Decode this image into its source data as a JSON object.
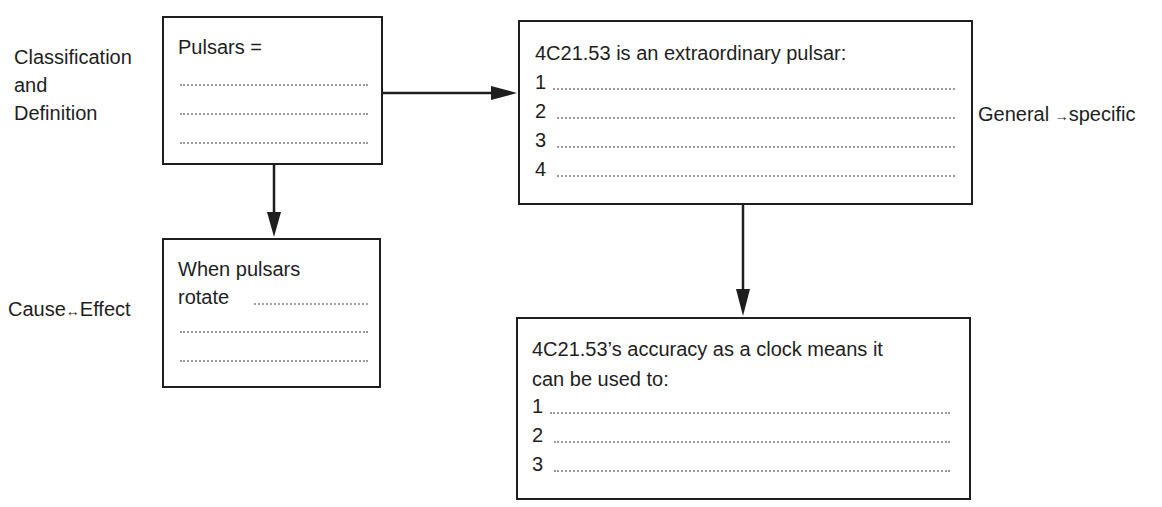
{
  "side_labels": {
    "classification": [
      "Classification",
      "and",
      "Definition"
    ],
    "cause_effect": {
      "left": "Cause",
      "arrow": "↔",
      "right": "Effect"
    },
    "general_specific": {
      "left": "General",
      "arrow": "→",
      "right": "specific"
    }
  },
  "boxes": {
    "pulsars": {
      "title": "Pulsars =",
      "blank_lines": 3
    },
    "extraordinary": {
      "title": "4C21.53 is an extraordinary pulsar:",
      "items": [
        "1",
        "2",
        "3",
        "4"
      ]
    },
    "rotate": {
      "title_line1": "When pulsars",
      "title_line2": "rotate",
      "blank_lines": 3
    },
    "clock": {
      "title_line1": "4C21.53’s accuracy as a clock means it",
      "title_line2": "can be used to:",
      "items": [
        "1",
        "2",
        "3"
      ]
    }
  },
  "colors": {
    "line": "#1e1e1e",
    "dots": "#9a9a9a",
    "background": "#ffffff"
  }
}
